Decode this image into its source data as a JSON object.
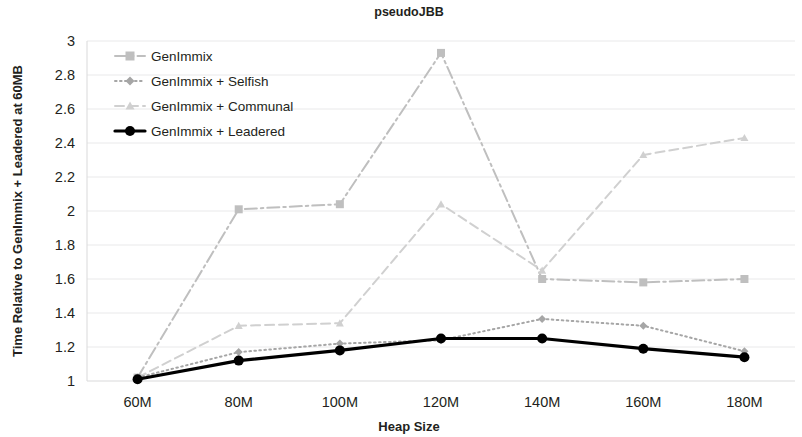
{
  "chart_data": {
    "type": "line",
    "title": "pseudoJBB",
    "xlabel": "Heap Size",
    "ylabel": "Time Relative to GenImmix + Leadered at 60MB",
    "categories": [
      "60M",
      "80M",
      "100M",
      "120M",
      "140M",
      "160M",
      "180M"
    ],
    "ylim": [
      1,
      3
    ],
    "ytick_labels": [
      "3",
      "2.8",
      "2.6",
      "2.4",
      "2.2",
      "2",
      "1.8",
      "1.6",
      "1.4",
      "1.2",
      "1"
    ],
    "ytick_values": [
      3,
      2.8,
      2.6,
      2.4,
      2.2,
      2,
      1.8,
      1.6,
      1.4,
      1.2,
      1
    ],
    "grid": true,
    "legend_position": "top-left",
    "series": [
      {
        "name": "GenImmix",
        "values": [
          1.02,
          2.01,
          2.04,
          2.93,
          1.6,
          1.58,
          1.6
        ],
        "color": "#bfbfbf",
        "marker": "square",
        "dash": "dashdot"
      },
      {
        "name": "GenImmix + Selfish",
        "values": [
          1.02,
          1.17,
          1.22,
          1.24,
          1.365,
          1.325,
          1.175
        ],
        "color": "#a6a6a6",
        "marker": "diamond",
        "dash": "dotted"
      },
      {
        "name": "GenImmix + Communal",
        "values": [
          1.02,
          1.325,
          1.34,
          2.04,
          1.65,
          2.33,
          2.43
        ],
        "color": "#d0d0d0",
        "marker": "triangle",
        "dash": "dashed"
      },
      {
        "name": "GenImmix + Leadered",
        "values": [
          1.01,
          1.12,
          1.18,
          1.25,
          1.25,
          1.19,
          1.14
        ],
        "color": "#000000",
        "marker": "circle",
        "dash": "solid"
      }
    ]
  }
}
